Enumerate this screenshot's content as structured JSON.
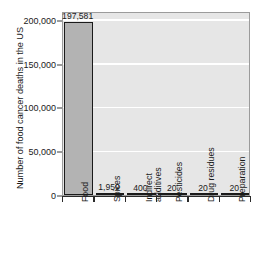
{
  "chart_data": {
    "type": "bar",
    "title": "",
    "xlabel": "",
    "ylabel": "Number of food cancer deaths in the US",
    "categories": [
      "Food",
      "Spices",
      "Indirect additives",
      "Pesticides",
      "Drug residues",
      "Preparation"
    ],
    "category_lines": [
      [
        "Food"
      ],
      [
        "Spices"
      ],
      [
        "Indirect",
        "additives"
      ],
      [
        "Pesticides"
      ],
      [
        "Drug residues"
      ],
      [
        "Preparation"
      ]
    ],
    "values": [
      197581,
      1959,
      400,
      20,
      20,
      20
    ],
    "value_labels": [
      "197,581",
      "1,959",
      "400",
      "20",
      "20",
      "20"
    ],
    "ylim": [
      0,
      210000
    ],
    "yticks": [
      0,
      50000,
      100000,
      150000,
      200000
    ],
    "ytick_labels": [
      "0",
      "50,000",
      "100,000",
      "150,000",
      "200,000"
    ],
    "grid": "horizontal-white",
    "legend": "none",
    "bar_color": "#b3b3b3",
    "bar_edge_color": "#1a1a1a",
    "plot_background": "#e6e6e6",
    "gridline_color": "#ffffff",
    "figure_background": "#ffffff",
    "text_color": "#1a1a1a"
  }
}
